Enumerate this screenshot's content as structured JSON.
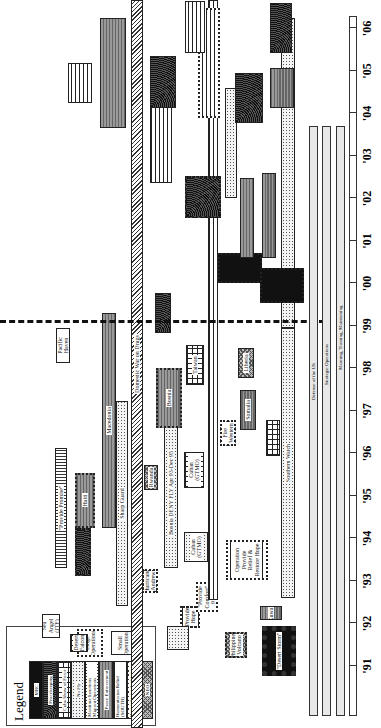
{
  "chart_data": {
    "type": "gantt",
    "title": "",
    "orientation": "rotated-90",
    "xlabel": "Year",
    "x_ticks": [
      "'91",
      "'92",
      "'93",
      "'94",
      "'95",
      "'96",
      "'97",
      "'98",
      "'99",
      "'00",
      "'01",
      "'02",
      "'03",
      "'04",
      "'05",
      "'06"
    ],
    "reference_line": {
      "year": 1997.0,
      "style": "dashed"
    },
    "lanes": [
      "Defense of the US",
      "Strategic Operations",
      "Manning, Training, Maintaining"
    ],
    "legend": {
      "title": "Legend",
      "categories": [
        "MRC",
        "Peacekeeping",
        "Cuba / Show of Force",
        "No Fly",
        "Maritime Sanctions / Migrant Operations",
        "Peace Enforcement",
        "Humanitarian Relief",
        "Humanitarian Assistance (CONUS)",
        "NEO",
        "SSF / Standing Forces"
      ],
      "size_keys": [
        "Large Operations",
        "Small Operations"
      ]
    },
    "operations": [
      {
        "label": "Desert Storm",
        "start": 1991.0,
        "end": 1991.5,
        "category": "MRC"
      },
      {
        "label": "Provide Comfort",
        "start": 1991.3,
        "end": 1996.9,
        "category": "SSF / Standing Forces"
      },
      {
        "label": "Southern Watch",
        "start": 1992.7,
        "end": 2006.0,
        "category": "No Fly"
      },
      {
        "label": "Provide Promise",
        "start": 1993.0,
        "end": 1996.0,
        "category": "Humanitarian Relief"
      },
      {
        "label": "Haiti",
        "start": 1994.2,
        "end": 1995.4,
        "category": "Peace Enforcement"
      },
      {
        "label": "Macedonia",
        "start": 1993.9,
        "end": 1999.0,
        "category": "Peacekeeping"
      },
      {
        "label": "Sharp Guard",
        "start": 1992.5,
        "end": 1996.5,
        "category": "Maritime Sanctions / Migrant Operations"
      },
      {
        "label": "Domestic War on Drugs",
        "start": 1989.0,
        "end": 2006.0,
        "category": "Humanitarian Assistance (CONUS)"
      },
      {
        "label": "Rwanda",
        "start": 1994.5,
        "end": 1995.0,
        "category": "Humanitarian Relief"
      },
      {
        "label": "Bosnia DENY FLY Apr 93-Dec 95",
        "start": 1993.3,
        "end": 1995.9,
        "category": "No Fly"
      },
      {
        "label": "Bosnia",
        "start": 1995.9,
        "end": 2006.0,
        "category": "Peace Enforcement"
      },
      {
        "label": "Cuban (GTMO)",
        "start": 1994.5,
        "end": 1995.4,
        "category": "Maritime Sanctions / Migrant Operations"
      },
      {
        "label": "Taiwan",
        "start": 1996.0,
        "end": 1996.8,
        "category": "Cuba / Show of Force"
      },
      {
        "label": "Liberia",
        "start": 1996.3,
        "end": 1996.9,
        "category": "NEO"
      },
      {
        "label": "Somalia",
        "start": 1995.4,
        "end": 1996.4,
        "category": "Peace Enforcement"
      },
      {
        "label": "Fire Western",
        "start": 1994.8,
        "end": 1995.3,
        "category": "Humanitarian Assistance (CONUS)"
      },
      {
        "label": "Operation Provide Relief & Restore Hope",
        "start": 1992.6,
        "end": 1993.8,
        "category": "Humanitarian Relief"
      },
      {
        "label": "Cuban (GTMO)",
        "start": 1992.6,
        "end": 1993.4,
        "category": "Maritime Sanctions / Migrant Operations"
      },
      {
        "label": "Kuwait",
        "start": 1992.6,
        "end": 1993.0,
        "category": "MRC"
      },
      {
        "label": "Sea Angel (JTF)",
        "start": 1991.6,
        "end": 1992.2,
        "category": "Humanitarian Relief"
      },
      {
        "label": "Desert Falcon",
        "start": 1991.6,
        "end": 1992.0,
        "category": "Cuba / Show of Force"
      },
      {
        "label": "Provide Hope",
        "start": 1991.8,
        "end": 1992.4,
        "category": "Humanitarian Relief"
      },
      {
        "label": "Fiery Vigil (Philippines Volcano)",
        "start": 1991.5,
        "end": 1992.0,
        "category": "Humanitarian Relief"
      },
      {
        "label": "Hurricane Andrew",
        "start": 1992.5,
        "end": 1993.0,
        "category": "Humanitarian Assistance (CONUS)"
      },
      {
        "label": "Pacific Haven",
        "start": 1996.7,
        "end": 1997.2,
        "category": "Humanitarian Relief"
      },
      {
        "label": "Iraq",
        "start": 1998.7,
        "end": 1999.5,
        "category": "MRC"
      },
      {
        "label": "Korea",
        "start": 1998.9,
        "end": 1999.7,
        "category": "MRC"
      }
    ]
  },
  "legend": {
    "title": "Legend",
    "items": [
      "MRC",
      "Peacekeeping",
      "Cuba Show of Force",
      "No Fly",
      "Maritime Sanctions Migrant Operations",
      "Peace Enforcement",
      "Humanitarian Relief (SOUTH)",
      "Humanitarian Assistance CONUS",
      "NEO",
      "SSF Standing Forces"
    ],
    "large": "Large Operations",
    "small": "Small Operations"
  },
  "labels": {
    "desert_storm": "\"Desert Storm\"",
    "southern_watch": "Southern Watch",
    "provide_promise": "\"Provide Promise\"",
    "haiti": "Haiti",
    "macedonia": "Macedonia",
    "sharp_guard": "Sharp Guard",
    "drugs": "Domestic War on Drugs",
    "bosnia_deny": "Bosnia DENY FLY Apr 93-Dec 95",
    "bosnia": "Bosnia",
    "rwanda": "Rwanda",
    "cuban1": "Cuban (GTMO)",
    "taiwan": "Taiwan",
    "liberia": "Liberia",
    "somalia": "Somalia",
    "fire": "Fire Western",
    "restore": "Operation Provide Relief & Restore Hope",
    "cuban2": "Cuban (GTMO)",
    "comfort": "\"Provide Comfort\" 91-96",
    "sea_angel": "Sea Angel (JTF)",
    "falcon": "Desert Falcon",
    "hope": "Provide Hope",
    "vigil": "Philippines Volcano",
    "andrew": "Hurricane Andrew",
    "pacific": "Pacific Haven",
    "kuwait": "Kuwait",
    "lane1": "Defense of the US",
    "lane2": "Strategic Operations",
    "lane3": "Manning, Training, Maintaining"
  }
}
